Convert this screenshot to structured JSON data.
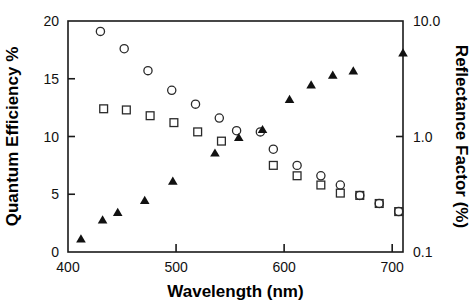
{
  "figure": {
    "background_color": "#ffffff",
    "foreground_color": "#111111",
    "width": 473,
    "height": 301
  },
  "chart_data": {
    "type": "scatter",
    "title": "",
    "xlabel": "Wavelength (nm)",
    "ylabel": "Quantum Efficiency %",
    "y2label": "Reflectance Factor  (%)",
    "xlim": [
      400,
      710
    ],
    "xticks": [
      400,
      500,
      600,
      700
    ],
    "xticklabels": [
      "400",
      "500",
      "600",
      "700"
    ],
    "ylim": [
      0,
      20
    ],
    "yticks": [
      0,
      5,
      10,
      15,
      20
    ],
    "yticklabels": [
      "0",
      "5",
      "10",
      "15",
      "20"
    ],
    "y2_scale": "log",
    "y2lim": [
      0.1,
      10.0
    ],
    "y2ticks": [
      0.1,
      1.0,
      10.0
    ],
    "y2ticklabels": [
      "0.1",
      "1.0",
      "10.0"
    ],
    "grid": false,
    "legend": "none",
    "series": [
      {
        "name": "Quantum efficiency (open circles)",
        "marker": "open-circle",
        "axis": "left",
        "unit": "%",
        "points": [
          {
            "x": 430,
            "y": 19.1
          },
          {
            "x": 452,
            "y": 17.6
          },
          {
            "x": 474,
            "y": 15.7
          },
          {
            "x": 496,
            "y": 14.0
          },
          {
            "x": 518,
            "y": 12.8
          },
          {
            "x": 540,
            "y": 11.6
          },
          {
            "x": 556,
            "y": 10.5
          },
          {
            "x": 578,
            "y": 10.4
          },
          {
            "x": 590,
            "y": 8.9
          },
          {
            "x": 612,
            "y": 7.5
          },
          {
            "x": 634,
            "y": 6.6
          },
          {
            "x": 652,
            "y": 5.8
          },
          {
            "x": 670,
            "y": 4.9
          },
          {
            "x": 688,
            "y": 4.2
          },
          {
            "x": 706,
            "y": 3.5
          }
        ]
      },
      {
        "name": "Quantum efficiency (open squares)",
        "marker": "open-square",
        "axis": "left",
        "unit": "%",
        "points": [
          {
            "x": 433,
            "y": 12.4
          },
          {
            "x": 454,
            "y": 12.3
          },
          {
            "x": 476,
            "y": 11.8
          },
          {
            "x": 498,
            "y": 11.2
          },
          {
            "x": 520,
            "y": 10.4
          },
          {
            "x": 542,
            "y": 9.6
          },
          {
            "x": 590,
            "y": 7.5
          },
          {
            "x": 612,
            "y": 6.6
          },
          {
            "x": 634,
            "y": 5.8
          },
          {
            "x": 652,
            "y": 5.1
          },
          {
            "x": 670,
            "y": 4.9
          },
          {
            "x": 688,
            "y": 4.2
          },
          {
            "x": 706,
            "y": 3.5
          }
        ]
      },
      {
        "name": "Reflectance factor (filled triangles)",
        "marker": "filled-triangle",
        "axis": "right",
        "unit": "%",
        "points": [
          {
            "x": 412,
            "y_left_equiv": 0.8,
            "y": 0.13
          },
          {
            "x": 432,
            "y_left_equiv": 2.5,
            "y": 0.19
          },
          {
            "x": 446,
            "y_left_equiv": 3.3,
            "y": 0.22
          },
          {
            "x": 471,
            "y_left_equiv": 4.4,
            "y": 0.28
          },
          {
            "x": 497,
            "y_left_equiv": 6.3,
            "y": 0.41
          },
          {
            "x": 536,
            "y_left_equiv": 9.0,
            "y": 0.72
          },
          {
            "x": 558,
            "y_left_equiv": 10.4,
            "y": 0.98
          },
          {
            "x": 580,
            "y_left_equiv": 11.1,
            "y": 1.15
          },
          {
            "x": 605,
            "y_left_equiv": 13.9,
            "y": 2.1
          },
          {
            "x": 625,
            "y_left_equiv": 15.1,
            "y": 2.8
          },
          {
            "x": 645,
            "y_left_equiv": 16.0,
            "y": 3.4
          },
          {
            "x": 664,
            "y_left_equiv": 16.4,
            "y": 3.7
          },
          {
            "x": 710,
            "y_left_equiv": 18.1,
            "y": 5.3
          }
        ]
      }
    ]
  }
}
